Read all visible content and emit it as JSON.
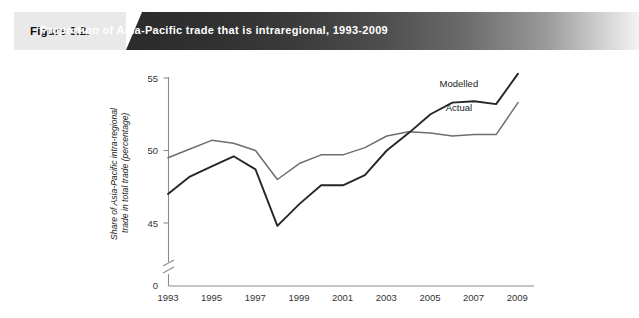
{
  "figure": {
    "label": "Figure 3.2.",
    "title": "Proportion of Asia-Pacific trade that is intraregional, 1993-2009"
  },
  "chart_data": {
    "type": "line",
    "title": "Proportion of Asia-Pacific trade that is intraregional, 1993-2009",
    "xlabel": "",
    "ylabel": "Share of Asia-Pacific intra-regional trade in total trade (percentage)",
    "ylabel_line1": "Share of Asia-Pacific intra-regional",
    "ylabel_line2": "trade in total trade (percentage)",
    "x": [
      1993,
      1994,
      1995,
      1996,
      1997,
      1998,
      1999,
      2000,
      2001,
      2002,
      2003,
      2004,
      2005,
      2006,
      2007,
      2008,
      2009
    ],
    "xticks": [
      "1993",
      "1995",
      "1997",
      "1999",
      "2001",
      "2003",
      "2005",
      "2007",
      "2009"
    ],
    "xtick_values": [
      1993,
      1995,
      1997,
      1999,
      2001,
      2003,
      2005,
      2007,
      2009
    ],
    "yticks": [
      "0",
      "45",
      "50",
      "55"
    ],
    "ytick_values": [
      0,
      45,
      50,
      55
    ],
    "ylim": [
      44.0,
      55.4
    ],
    "axis_break": true,
    "axis_break_note": "y-axis broken between 0 and 44",
    "grid": false,
    "legend": "inline-labels",
    "series": [
      {
        "name": "Modelled",
        "color": "#262626",
        "label_x": 2006.3,
        "label_y": 54.4,
        "values": [
          47.0,
          48.2,
          48.9,
          49.6,
          48.7,
          44.8,
          46.3,
          47.6,
          47.6,
          48.3,
          50.0,
          51.2,
          52.5,
          53.3,
          53.4,
          53.2,
          55.3
        ]
      },
      {
        "name": "Actual",
        "color": "#6e6e6e",
        "label_x": 2006.3,
        "label_y": 52.7,
        "values": [
          49.5,
          50.1,
          50.7,
          50.5,
          50.0,
          48.0,
          49.1,
          49.7,
          49.7,
          50.2,
          51.0,
          51.3,
          51.2,
          51.0,
          51.1,
          51.1,
          53.3
        ]
      }
    ]
  },
  "colors": {
    "modelled": "#262626",
    "actual": "#6e6e6e",
    "axis": "#8c8c8c",
    "banner_label_bg": "#e9e9e9",
    "banner_dark": "#2b2b2b"
  }
}
